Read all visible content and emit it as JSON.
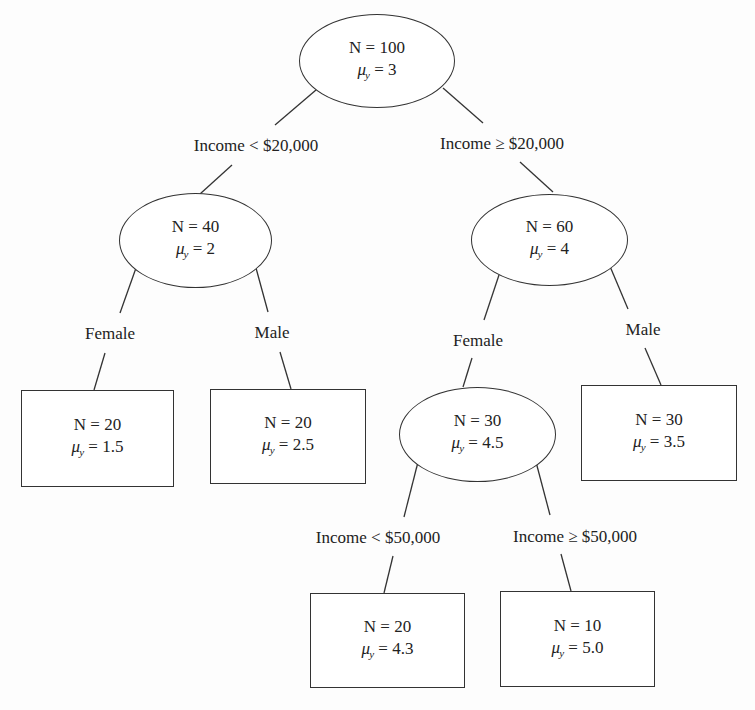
{
  "diagram": {
    "type": "regression-tree",
    "mu_symbol": "μ",
    "mu_subscript": "y",
    "nodes": {
      "root": {
        "shape": "ellipse",
        "n": "N = 100",
        "mu": " = 3"
      },
      "low_income": {
        "shape": "ellipse",
        "n": "N = 40",
        "mu": " = 2"
      },
      "high_income": {
        "shape": "ellipse",
        "n": "N = 60",
        "mu": " = 4"
      },
      "low_female": {
        "shape": "rect",
        "n": "N = 20",
        "mu": " = 1.5"
      },
      "low_male": {
        "shape": "rect",
        "n": "N = 20",
        "mu": " = 2.5"
      },
      "high_female": {
        "shape": "ellipse",
        "n": "N = 30",
        "mu": " = 4.5"
      },
      "high_male": {
        "shape": "rect",
        "n": "N = 30",
        "mu": " = 3.5"
      },
      "high_female_lt50k": {
        "shape": "rect",
        "n": "N = 20",
        "mu": " = 4.3"
      },
      "high_female_ge50k": {
        "shape": "rect",
        "n": "N = 10",
        "mu": " = 5.0"
      }
    },
    "edges": {
      "root_to_low": "Income < $20,000",
      "root_to_high": "Income ≥ $20,000",
      "low_to_female": "Female",
      "low_to_male": "Male",
      "high_to_female": "Female",
      "high_to_male": "Male",
      "female_to_lt50k": "Income < $50,000",
      "female_to_ge50k": "Income ≥ $50,000"
    }
  }
}
